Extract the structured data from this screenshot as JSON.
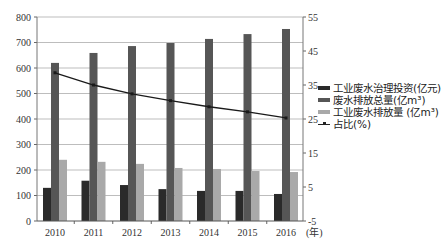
{
  "chart_data": {
    "type": "bar",
    "title": "",
    "xlabel": "(年)",
    "ylabel_left": "",
    "ylabel_right": "",
    "categories": [
      "2010",
      "2011",
      "2012",
      "2013",
      "2014",
      "2015",
      "2016"
    ],
    "series": [
      {
        "name": "工业废水治理投资(亿元)",
        "type": "bar",
        "axis": "left",
        "color": "#2a2a2a",
        "values": [
          130,
          158,
          141,
          125,
          118,
          118,
          106
        ]
      },
      {
        "name": "废水排放总量(亿m³)",
        "type": "bar",
        "axis": "left",
        "color": "#565656",
        "values": [
          620,
          659,
          686,
          698,
          714,
          733,
          753
        ]
      },
      {
        "name": "工业废水排放量 (亿m³)",
        "type": "bar",
        "axis": "left",
        "color": "#a9a9a9",
        "values": [
          240,
          232,
          224,
          208,
          204,
          196,
          192
        ]
      },
      {
        "name": "占比(%)",
        "type": "line",
        "axis": "right",
        "color": "#1a1a1a",
        "values": [
          38.6,
          35.0,
          32.4,
          30.4,
          28.6,
          27.1,
          25.3
        ]
      }
    ],
    "ylim_left": [
      0,
      800
    ],
    "yticks_left": [
      0,
      100,
      200,
      300,
      400,
      500,
      600,
      700,
      800
    ],
    "ylim_right": [
      -5,
      55
    ],
    "yticks_right": [
      -5,
      5,
      15,
      25,
      35,
      45,
      55
    ],
    "grid": true,
    "legend_position": "right"
  },
  "legend": {
    "items": [
      {
        "label": "工业废水治理投资(亿元)"
      },
      {
        "label": "废水排放总量(亿m³)"
      },
      {
        "label": "工业废水排放量 (亿m³)"
      },
      {
        "label": "占比(%)"
      }
    ]
  }
}
